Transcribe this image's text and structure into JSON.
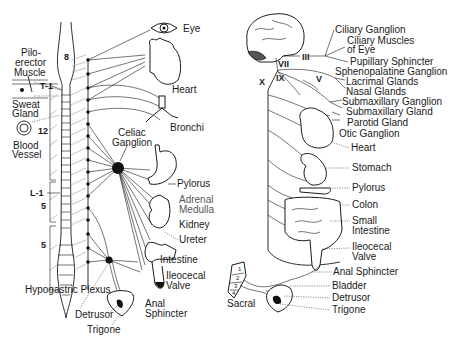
{
  "diagram": {
    "colors": {
      "ink": "#1a1a1a",
      "background": "#ffffff",
      "dotted": "#444444",
      "gray": "#999999"
    },
    "sympathetic": {
      "spinal_labels": {
        "cervical": "8",
        "thoracic_start": "T-1",
        "thoracic": "12",
        "lumbar_start": "L-1",
        "lumbar": "5",
        "sacral": "5"
      },
      "skin_labels": {
        "pilo": "Pilo-",
        "erector": "erector",
        "muscle": "Muscle",
        "sweat": "Sweat",
        "gland": "Gland",
        "blood": "Blood",
        "vessel": "Vessel"
      },
      "ganglia": {
        "celiac_line1": "Celiac",
        "celiac_line2": "Ganglion",
        "hypogastric": "Hypogastric Plexus"
      },
      "organs": {
        "eye": "Eye",
        "heart": "Heart",
        "bronchi": "Bronchi",
        "pylorus": "Pylorus",
        "adrenal_line1": "Adrenal",
        "adrenal_line2": "Medulla",
        "kidney": "Kidney",
        "ureter": "Ureter",
        "intestine": "Intestine",
        "ileocecal_line1": "Ileocecal",
        "ileocecal_line2": "Valve",
        "anal_line1": "Anal",
        "anal_line2": "Sphincter",
        "detrusor": "Detrusor",
        "trigone": "Trigone"
      }
    },
    "parasympathetic": {
      "cranial_nerves": {
        "III": "III",
        "VII": "VII",
        "IX": "IX",
        "X": "X",
        "V": "V"
      },
      "sacral_label": "Sacral",
      "sacral_numbers": [
        "1",
        "2",
        "3",
        "4"
      ],
      "labels": {
        "ciliary_ganglion": "Ciliary Ganglion",
        "ciliary_muscles_line1": "Ciliary Muscles",
        "ciliary_muscles_line2": "of Eye",
        "pupillary": "Pupillary Sphincter",
        "sphenopalatine": "Sphenopalatine Ganglion",
        "lacrimal": "Lacrimal Glands",
        "nasal": "Nasal Glands",
        "submax_ganglion": "Submaxillary Ganglion",
        "submax_gland": "Submaxillary Gland",
        "parotid": "Parotid Gland",
        "otic": "Otic Ganglion",
        "heart": "Heart",
        "stomach": "Stomach",
        "pylorus": "Pylorus",
        "colon": "Colon",
        "small_int_line1": "Small",
        "small_int_line2": "Intestine",
        "ileocecal_line1": "Ileocecal",
        "ileocecal_line2": "Valve",
        "anal": "Anal Sphincter",
        "bladder": "Bladder",
        "detrusor": "Detrusor",
        "trigone": "Trigone"
      }
    }
  }
}
